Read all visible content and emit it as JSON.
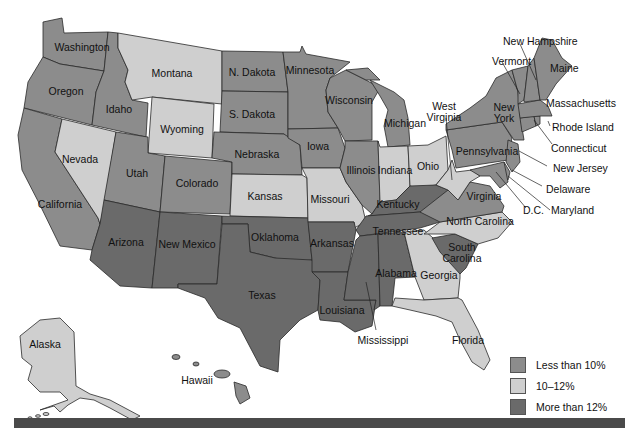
{
  "colors": {
    "low": "#8c8c8c",
    "mid": "#cfcfcf",
    "high": "#6a6a6a",
    "bar": "#4a4a4a"
  },
  "legend": {
    "items": [
      {
        "label": "Less than 10%",
        "category": "low"
      },
      {
        "label": "10–12%",
        "category": "mid"
      },
      {
        "label": "More than 12%",
        "category": "high"
      }
    ]
  },
  "states": {
    "washington": {
      "label": "Washington",
      "category": "low"
    },
    "oregon": {
      "label": "Oregon",
      "category": "low"
    },
    "california": {
      "label": "California",
      "category": "low"
    },
    "idaho": {
      "label": "Idaho",
      "category": "low"
    },
    "nevada": {
      "label": "Nevada",
      "category": "mid"
    },
    "montana": {
      "label": "Montana",
      "category": "mid"
    },
    "wyoming": {
      "label": "Wyoming",
      "category": "mid"
    },
    "utah": {
      "label": "Utah",
      "category": "low"
    },
    "colorado": {
      "label": "Colorado",
      "category": "low"
    },
    "arizona": {
      "label": "Arizona",
      "category": "high"
    },
    "new_mexico": {
      "label": "New Mexico",
      "category": "high"
    },
    "n_dakota": {
      "label": "N. Dakota",
      "category": "low"
    },
    "s_dakota": {
      "label": "S. Dakota",
      "category": "low"
    },
    "nebraska": {
      "label": "Nebraska",
      "category": "low"
    },
    "kansas": {
      "label": "Kansas",
      "category": "mid"
    },
    "oklahoma": {
      "label": "Oklahoma",
      "category": "high"
    },
    "texas": {
      "label": "Texas",
      "category": "high"
    },
    "minnesota": {
      "label": "Minnesota",
      "category": "low"
    },
    "iowa": {
      "label": "Iowa",
      "category": "low"
    },
    "missouri": {
      "label": "Missouri",
      "category": "mid"
    },
    "arkansas": {
      "label": "Arkansas",
      "category": "high"
    },
    "louisiana": {
      "label": "Louisiana",
      "category": "high"
    },
    "wisconsin": {
      "label": "Wisconsin",
      "category": "low"
    },
    "illinois": {
      "label": "Illinois",
      "category": "low"
    },
    "michigan": {
      "label": "Michigan",
      "category": "low"
    },
    "indiana": {
      "label": "Indiana",
      "category": "mid"
    },
    "ohio": {
      "label": "Ohio",
      "category": "mid"
    },
    "kentucky": {
      "label": "Kentucky",
      "category": "high"
    },
    "tennessee": {
      "label": "Tennessee",
      "category": "high"
    },
    "mississippi": {
      "label": "Mississippi",
      "category": "high"
    },
    "alabama": {
      "label": "Alabama",
      "category": "high"
    },
    "georgia": {
      "label": "Georgia",
      "category": "mid"
    },
    "florida": {
      "label": "Florida",
      "category": "mid"
    },
    "south_carolina": {
      "label": "South Carolina",
      "category": "high"
    },
    "north_carolina": {
      "label": "North Carolina",
      "category": "mid"
    },
    "virginia": {
      "label": "Virginia",
      "category": "low"
    },
    "west_virginia": {
      "label": "West Virginia",
      "category": "mid"
    },
    "pennsylvania": {
      "label": "Pennsylvania",
      "category": "low"
    },
    "new_york": {
      "label": "New York",
      "category": "low"
    },
    "new_jersey": {
      "label": "New Jersey",
      "category": "low"
    },
    "delaware": {
      "label": "Delaware",
      "category": "low"
    },
    "maryland": {
      "label": "Maryland",
      "category": "low"
    },
    "dc": {
      "label": "D.C.",
      "category": "low"
    },
    "connecticut": {
      "label": "Connecticut",
      "category": "low"
    },
    "rhode_island": {
      "label": "Rhode Island",
      "category": "low"
    },
    "massachusetts": {
      "label": "Massachusetts",
      "category": "low"
    },
    "vermont": {
      "label": "Vermont",
      "category": "low"
    },
    "new_hampshire": {
      "label": "New Hampshire",
      "category": "low"
    },
    "maine": {
      "label": "Maine",
      "category": "low"
    },
    "alaska": {
      "label": "Alaska",
      "category": "mid"
    },
    "hawaii": {
      "label": "Hawaii",
      "category": "low"
    }
  }
}
